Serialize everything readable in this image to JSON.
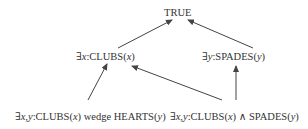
{
  "diagram": {
    "type": "lattice",
    "nodes": [
      {
        "id": "true",
        "label": "TRUE"
      },
      {
        "id": "exists_clubs",
        "label": "∃x:CLUBS(x)"
      },
      {
        "id": "exists_spades",
        "label": "∃y:SPADES(y)"
      },
      {
        "id": "clubs_wedge_hearts",
        "label": "∃x,y:CLUBS(x) wedge HEARTS(y)"
      },
      {
        "id": "clubs_and_spades",
        "label": "∃x,y:CLUBS(x) ∧ SPADES(y)"
      }
    ],
    "edges": [
      {
        "from": "exists_clubs",
        "to": "true"
      },
      {
        "from": "exists_spades",
        "to": "true"
      },
      {
        "from": "clubs_wedge_hearts",
        "to": "exists_clubs"
      },
      {
        "from": "clubs_and_spades",
        "to": "exists_clubs"
      },
      {
        "from": "clubs_and_spades",
        "to": "exists_spades"
      }
    ],
    "edge_color": "#444444",
    "text_color": "#333333"
  },
  "labels": {
    "true": "TRUE",
    "n1": {
      "q": "∃",
      "v": "x",
      "sep": ":CLUBS(",
      "arg": "x",
      "end": ")"
    },
    "n2": {
      "q": "∃",
      "v": "y",
      "sep": ":SPADES(",
      "arg": "y",
      "end": ")"
    },
    "n3": {
      "q": "∃",
      "v": "x,y",
      "sep": ":CLUBS(",
      "arg1": "x",
      "mid": ") wedge HEARTS(",
      "arg2": "y",
      "end": ")"
    },
    "n4": {
      "q": "∃",
      "v": "x,y",
      "sep": ":CLUBS(",
      "arg1": "x",
      "mid": ") ∧ SPADES(",
      "arg2": "y",
      "end": ")"
    }
  }
}
